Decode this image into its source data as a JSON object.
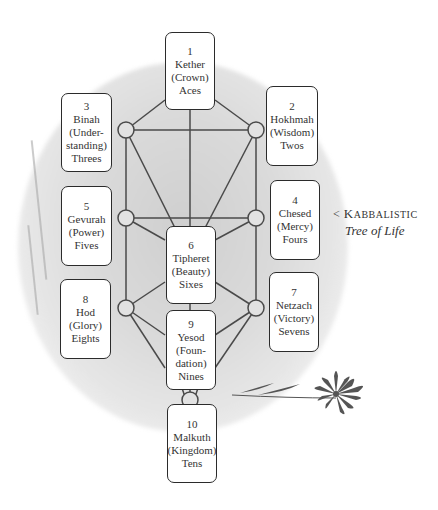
{
  "caption": {
    "arrow": "<",
    "title_first": "K",
    "title_rest": "ABBALISTIC",
    "subtitle": "Tree of Life"
  },
  "sephirot": [
    {
      "num": "1",
      "name": "Kether",
      "meaning": "(Crown)",
      "cards": "Aces"
    },
    {
      "num": "2",
      "name": "Hokhmah",
      "meaning": "(Wisdom)",
      "cards": "Twos"
    },
    {
      "num": "3",
      "name": "Binah",
      "meaning_1": "(Under-",
      "meaning_2": "standing)",
      "cards": "Threes"
    },
    {
      "num": "4",
      "name": "Chesed",
      "meaning": "(Mercy)",
      "cards": "Fours"
    },
    {
      "num": "5",
      "name": "Gevurah",
      "meaning": "(Power)",
      "cards": "Fives"
    },
    {
      "num": "6",
      "name": "Tipheret",
      "meaning": "(Beauty)",
      "cards": "Sixes"
    },
    {
      "num": "7",
      "name": "Netzach",
      "meaning": "(Victory)",
      "cards": "Sevens"
    },
    {
      "num": "8",
      "name": "Hod",
      "meaning": "(Glory)",
      "cards": "Eights"
    },
    {
      "num": "9",
      "name": "Yesod",
      "meaning_1": "(Foun-",
      "meaning_2": "dation)",
      "cards": "Nines"
    },
    {
      "num": "10",
      "name": "Malkuth",
      "meaning": "(Kingdom)",
      "cards": "Tens"
    }
  ],
  "colors": {
    "line": "#4a4a4a",
    "box_border": "#2b2b2b",
    "background_wash": "#d6d6d6",
    "text": "#333333"
  }
}
